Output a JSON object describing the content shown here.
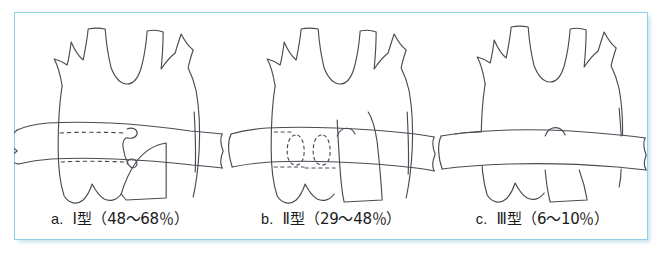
{
  "figure": {
    "background_color": "#ffffff",
    "frame_color": "#8fd0e8",
    "ink_color": "#4a4a55",
    "panel_count": 3
  },
  "panels": [
    {
      "id": "panel-a",
      "letter": "a.",
      "type_label": "Ⅰ型",
      "range_label": "（48〜68％）",
      "caption_full": "a.　Ⅰ型（48〜68％）",
      "percent_low": 48,
      "percent_high": 68,
      "band_relation": "behind",
      "hidden_segment_style": "dashed-lines"
    },
    {
      "id": "panel-b",
      "letter": "b.",
      "type_label": "Ⅱ型",
      "range_label": "（29〜48％）",
      "caption_full": "b.　Ⅱ型（29〜48％）",
      "percent_low": 29,
      "percent_high": 48,
      "band_relation": "behind",
      "hidden_segment_style": "dashed-ovals"
    },
    {
      "id": "panel-c",
      "letter": "c.",
      "type_label": "Ⅲ型",
      "range_label": "（6〜10％）",
      "caption_full": "c.　Ⅲ型（6〜10％）",
      "percent_low": 6,
      "percent_high": 10,
      "band_relation": "front",
      "hidden_segment_style": "none"
    }
  ]
}
